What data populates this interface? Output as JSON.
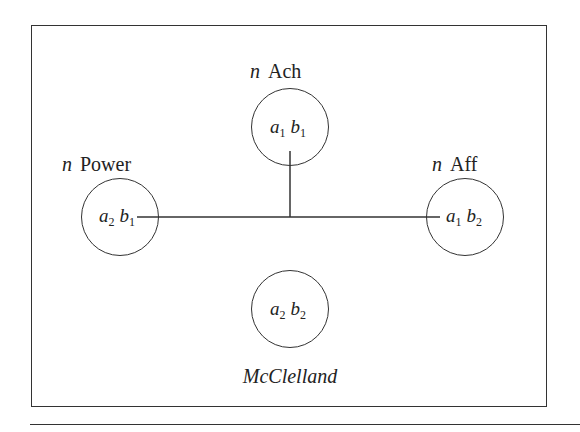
{
  "diagram": {
    "caption": "McClelland",
    "nodes": [
      {
        "id": "ach",
        "prefix": "n",
        "label": "Ach",
        "a": "a",
        "a_sub": "1",
        "b": "b",
        "b_sub": "1"
      },
      {
        "id": "power",
        "prefix": "n",
        "label": "Power",
        "a": "a",
        "a_sub": "2",
        "b": "b",
        "b_sub": "1"
      },
      {
        "id": "aff",
        "prefix": "n",
        "label": "Aff",
        "a": "a",
        "a_sub": "1",
        "b": "b",
        "b_sub": "2"
      },
      {
        "id": "none",
        "prefix": "",
        "label": "",
        "a": "a",
        "a_sub": "2",
        "b": "b",
        "b_sub": "2"
      }
    ],
    "edges": [
      {
        "from": "power",
        "to": "aff",
        "type": "horizontal"
      },
      {
        "from": "ach",
        "to": "power-aff-line",
        "type": "vertical"
      }
    ]
  }
}
